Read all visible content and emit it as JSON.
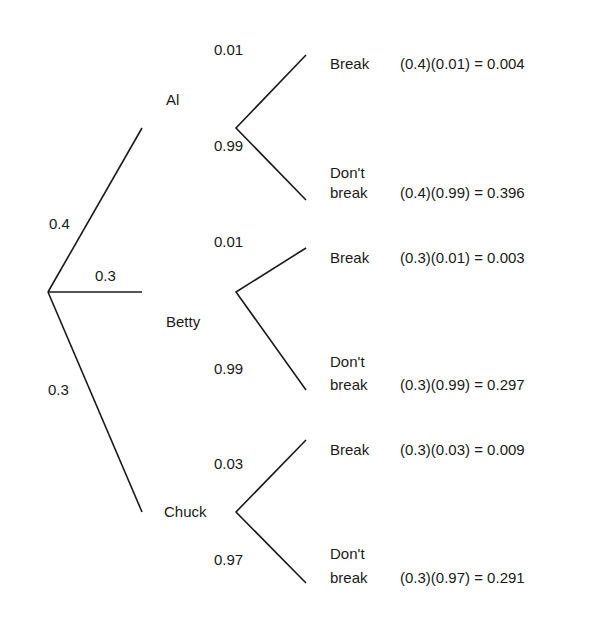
{
  "diagram": {
    "type": "probability-tree",
    "first_level": [
      {
        "name": "Al",
        "prob": "0.4"
      },
      {
        "name": "Betty",
        "prob": "0.3"
      },
      {
        "name": "Chuck",
        "prob": "0.3"
      }
    ],
    "second_level": [
      {
        "parent": "Al",
        "break_prob": "0.01",
        "dont_prob": "0.99",
        "break_label": "Break",
        "dont_label_1": "Don't",
        "dont_label_2": "break",
        "break_calc": "(0.4)(0.01) = 0.004",
        "dont_calc": "(0.4)(0.99) = 0.396"
      },
      {
        "parent": "Betty",
        "break_prob": "0.01",
        "dont_prob": "0.99",
        "break_label": "Break",
        "dont_label_1": "Don't",
        "dont_label_2": "break",
        "break_calc": "(0.3)(0.01) = 0.003",
        "dont_calc": "(0.3)(0.99) = 0.297"
      },
      {
        "parent": "Chuck",
        "break_prob": "0.03",
        "dont_prob": "0.97",
        "break_label": "Break",
        "dont_label_1": "Don't",
        "dont_label_2": "break",
        "break_calc": "(0.3)(0.03) = 0.009",
        "dont_calc": "(0.3)(0.97) = 0.291"
      }
    ],
    "line_color": "#1a1a1a"
  }
}
